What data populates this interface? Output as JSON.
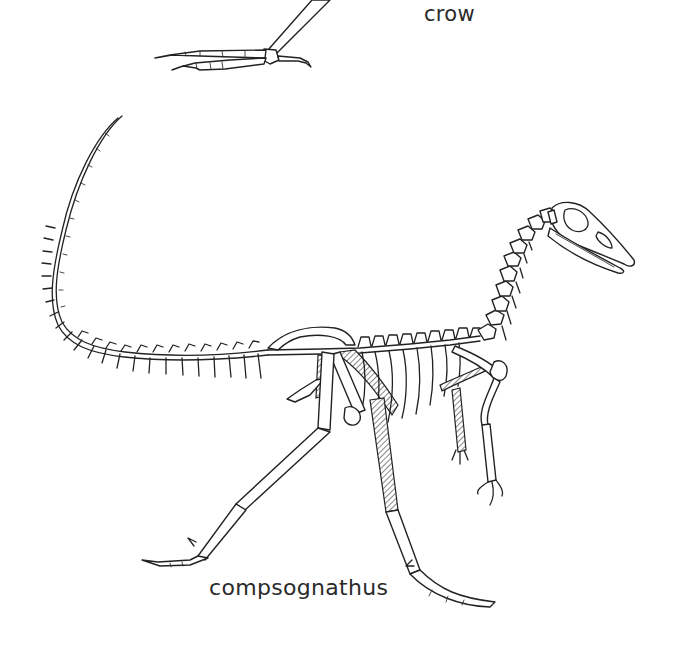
{
  "figure": {
    "labels": {
      "crow": "crow",
      "compsognathus": "compsognathus"
    },
    "elements": {
      "crow_foot": "crow-foot-skeleton",
      "compsognathus_skeleton": "compsognathus-skeleton"
    },
    "colors": {
      "background": "#ffffff",
      "ink": "#222222",
      "label": "#2a2a2a"
    }
  }
}
